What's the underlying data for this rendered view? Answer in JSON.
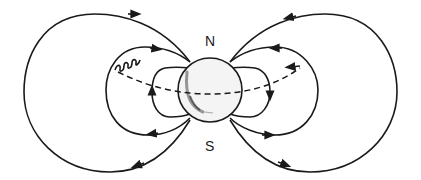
{
  "diagram": {
    "type": "magnetic-dipole-field",
    "labels": {
      "north": "N",
      "south": "S"
    },
    "elements": [
      "earth-globe",
      "outer-field-loop-left",
      "middle-field-loop-left",
      "inner-field-loop-left",
      "outer-field-loop-right",
      "middle-field-loop-right",
      "inner-field-loop-right",
      "magnetic-equator-dashed-line",
      "spiraling-particle-trajectory"
    ],
    "colors": {
      "line": "#1a1a1a",
      "background": "#ffffff",
      "globe_fill": "#f4f4f4"
    }
  }
}
